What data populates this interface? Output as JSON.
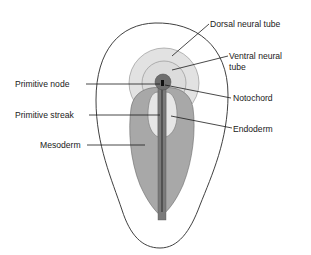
{
  "diagram": {
    "title": "",
    "labels": {
      "dorsal_neural_tube": "Dorsal neural tube",
      "ventral_neural_tube_line1": "Ventral neural",
      "ventral_neural_tube_line2": "tube",
      "primitive_node": "Primitive node",
      "notochord": "Notochord",
      "primitive_streak": "Primitive streak",
      "endoderm": "Endoderm",
      "mesoderm": "Mesoderm"
    },
    "colors": {
      "outline": "#2a2a2a",
      "epiblast_fill": "#ffffff",
      "dorsal_neural_tube_fill": "#e2e2e2",
      "ventral_neural_tube_fill": "#d8d8d8",
      "mesoderm_fill": "#a8a8a8",
      "endoderm_fill": "#e6e6e6",
      "node_fill": "#6e6e6e",
      "streak_fill": "#7a7a7a",
      "notochord_fill": "#1a1a1a"
    }
  }
}
